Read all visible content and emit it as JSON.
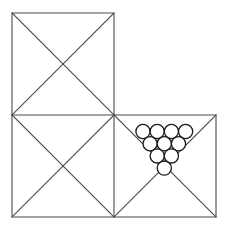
{
  "figure": {
    "canvas": {
      "width": 229,
      "height": 233,
      "background": "#ffffff"
    },
    "style": {
      "line_color": "#4a4a4a",
      "line_width": 1.1,
      "circle_stroke_color": "#1a1a1a",
      "circle_stroke_width": 1.3,
      "circle_fill": "#ffffff"
    },
    "geometry": {
      "grid_origin_x": 12,
      "grid_origin_y": 13,
      "cell_size": 102,
      "squares": [
        {
          "name": "top-left-square",
          "col": 0,
          "row": 0,
          "x": 12,
          "y": 13,
          "size": 102
        },
        {
          "name": "bottom-left-square",
          "col": 0,
          "row": 1,
          "x": 12,
          "y": 115,
          "size": 102
        },
        {
          "name": "bottom-right-square",
          "col": 1,
          "row": 1,
          "x": 114,
          "y": 115,
          "size": 102
        }
      ],
      "outline_path": "M 12 13 L 114 13 L 114 115 L 216 115 L 216 217 L 12 217 Z",
      "interior_segments": [
        {
          "name": "horizontal-divider",
          "x1": 12,
          "y1": 115,
          "x2": 114,
          "y2": 115
        },
        {
          "name": "vertical-divider",
          "x1": 114,
          "y1": 115,
          "x2": 114,
          "y2": 217
        }
      ],
      "diagonals": [
        {
          "name": "top-left-diagonal-tlbr",
          "x1": 12,
          "y1": 13,
          "x2": 114,
          "y2": 115
        },
        {
          "name": "top-left-diagonal-trbl",
          "x1": 114,
          "y1": 13,
          "x2": 12,
          "y2": 115
        },
        {
          "name": "bottom-left-diagonal-tlbr",
          "x1": 12,
          "y1": 115,
          "x2": 114,
          "y2": 217
        },
        {
          "name": "bottom-left-diagonal-trbl",
          "x1": 114,
          "y1": 115,
          "x2": 12,
          "y2": 217
        },
        {
          "name": "bottom-right-diagonal-tlbr",
          "x1": 114,
          "y1": 115,
          "x2": 216,
          "y2": 217
        },
        {
          "name": "bottom-right-diagonal-trbl",
          "x1": 216,
          "y1": 115,
          "x2": 114,
          "y2": 217
        }
      ]
    },
    "circle_pack": {
      "location": "bottom-right-square upper triangle",
      "total_count": 10,
      "radius": 7.1,
      "rows": [
        {
          "row_index": 0,
          "count": 4,
          "cy": 131.5,
          "centers_x": [
            143.0,
            157.2,
            171.4,
            185.6
          ]
        },
        {
          "row_index": 1,
          "count": 3,
          "cy": 143.7,
          "centers_x": [
            150.1,
            164.3,
            178.5
          ]
        },
        {
          "row_index": 2,
          "count": 2,
          "cy": 155.9,
          "centers_x": [
            157.2,
            171.4
          ]
        },
        {
          "row_index": 3,
          "count": 1,
          "cy": 168.1,
          "centers_x": [
            164.3
          ]
        }
      ]
    }
  }
}
